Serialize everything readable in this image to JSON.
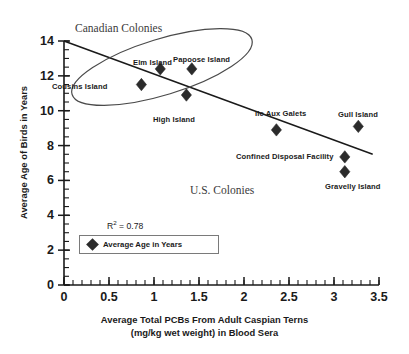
{
  "chart_data": {
    "type": "scatter",
    "title": "",
    "xlabel": "Average Total PCBs From Adult Caspian Terns (mg/kg wet weight) in Blood Sera",
    "xlabel_line1": "Average Total PCBs From Adult Caspian Terns",
    "xlabel_line2": "(mg/kg wet weight) in Blood Sera",
    "ylabel": "Average Age of Birds in Years",
    "xlim": [
      0,
      3.5
    ],
    "ylim": [
      0,
      14
    ],
    "xticks": [
      0,
      0.5,
      1,
      1.5,
      2,
      2.5,
      3,
      3.5
    ],
    "xtick_labels": [
      "0",
      "0.5",
      "1",
      "1.5",
      "2",
      "2.5",
      "3",
      "3.5"
    ],
    "xtick_minor_step": 0.1,
    "yticks": [
      0,
      2,
      4,
      6,
      8,
      10,
      12,
      14
    ],
    "ytick_labels": [
      "0",
      "2",
      "4",
      "6",
      "8",
      "10",
      "12",
      "14"
    ],
    "ytick_minor_step": 0.5,
    "grid": false,
    "legend_position": "lower-left",
    "legend_entries": [
      "Average Age in Years"
    ],
    "marker_shape": "diamond",
    "marker_color": "#2b2b2b",
    "annotations": [
      {
        "name": "r-squared",
        "text": "R2 = 0.78",
        "display": "R",
        "sup": "2",
        "rest": " = 0.78"
      },
      {
        "name": "canadian-colonies-group",
        "text": "Canadian Colonies"
      },
      {
        "name": "us-colonies-group",
        "text": "U.S. Colonies"
      }
    ],
    "trendline": {
      "type": "linear",
      "x_start": 0,
      "y_start": 14.0,
      "x_end": 3.43,
      "y_end": 7.5,
      "r_squared": 0.78
    },
    "group_ellipse": {
      "label": "Canadian Colonies",
      "members": [
        "Cousins Island",
        "Elm Island",
        "Papoose Island"
      ]
    },
    "points": [
      {
        "label": "Cousins Island",
        "x": 0.86,
        "y": 11.5,
        "label_pos": "left"
      },
      {
        "label": "Elm Island",
        "x": 1.07,
        "y": 12.4,
        "label_pos": "above"
      },
      {
        "label": "Papoose Island",
        "x": 1.42,
        "y": 12.4,
        "label_pos": "above"
      },
      {
        "label": "High Island",
        "x": 1.36,
        "y": 10.9,
        "label_pos": "below"
      },
      {
        "label": "Ile Aux Galets",
        "x": 2.36,
        "y": 8.9,
        "label_pos": "above"
      },
      {
        "label": "Gull Island",
        "x": 3.27,
        "y": 9.1,
        "label_pos": "above"
      },
      {
        "label": "Confined Disposal Facility",
        "x": 3.12,
        "y": 7.35,
        "label_pos": "left"
      },
      {
        "label": "Gravelly Island",
        "x": 3.12,
        "y": 6.5,
        "label_pos": "below"
      }
    ]
  },
  "labels": {
    "canadian_colonies": "Canadian Colonies",
    "us_colonies": "U.S. Colonies",
    "cousins_island": "Cousins Island",
    "elm_island": "Elm Island",
    "papoose_island": "Papoose Island",
    "high_island": "High Island",
    "ile_aux_galets": "Ile Aux Galets",
    "gull_island": "Gull Island",
    "confined_disposal_facility": "Confined Disposal Facility",
    "gravelly_island": "Gravelly Island"
  },
  "axes": {
    "x_title_line1": "Average Total PCBs From Adult Caspian Terns",
    "x_title_line2": "(mg/kg wet weight) in Blood Sera",
    "y_title": "Average Age of Birds in Years",
    "x_tick_0": "0",
    "x_tick_1": "0.5",
    "x_tick_2": "1",
    "x_tick_3": "1.5",
    "x_tick_4": "2",
    "x_tick_5": "2.5",
    "x_tick_6": "3",
    "x_tick_7": "3.5",
    "y_tick_0": "0",
    "y_tick_1": "2",
    "y_tick_2": "4",
    "y_tick_3": "6",
    "y_tick_4": "8",
    "y_tick_5": "10",
    "y_tick_6": "12",
    "y_tick_7": "14"
  },
  "legend": {
    "entry_label": "Average Age in Years"
  },
  "stats": {
    "r_symbol": "R",
    "r_exponent": "2",
    "r_value": " = 0.78"
  }
}
